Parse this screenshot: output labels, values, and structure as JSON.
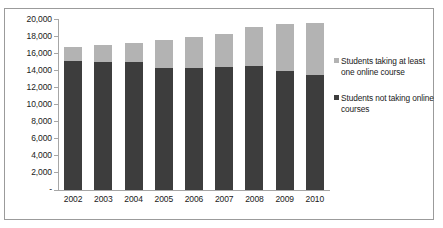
{
  "chart_data": {
    "type": "bar",
    "subtype": "stacked-column",
    "title": "",
    "subtitle": "",
    "xlabel": "",
    "ylabel": "",
    "categories": [
      "2002",
      "2003",
      "2004",
      "2005",
      "2006",
      "2007",
      "2008",
      "2009",
      "2010"
    ],
    "series": [
      {
        "name": "Students not taking online courses",
        "color": "#3d3d3d",
        "values": [
          15100,
          15000,
          14950,
          14250,
          14250,
          14350,
          14500,
          13900,
          13450
        ]
      },
      {
        "name": "Students taking at least one online course",
        "color": "#b3b3b3",
        "values": [
          1600,
          1950,
          2300,
          3250,
          3600,
          3900,
          4550,
          5550,
          6100
        ]
      }
    ],
    "totals": [
      16700,
      16950,
      17250,
      17500,
      17850,
      18250,
      19050,
      19450,
      19550
    ],
    "ylim": [
      0,
      20000
    ],
    "ytick_step": 2000,
    "ytick_labels": [
      "20,000",
      "18,000",
      "16,000",
      "14,000",
      "12,000",
      "10,000",
      "8,000",
      "6,000",
      "4,000",
      "2,000",
      "-"
    ],
    "ytick_values": [
      20000,
      18000,
      16000,
      14000,
      12000,
      10000,
      8000,
      6000,
      4000,
      2000,
      0
    ],
    "grid": false,
    "legend_position": "right",
    "legend": [
      {
        "label": "Students taking at least one online course",
        "color": "#b3b3b3"
      },
      {
        "label": "Students not taking online courses",
        "color": "#3d3d3d"
      }
    ]
  },
  "colors": {
    "online": "#b3b3b3",
    "not_online": "#3d3d3d",
    "axis": "#a6a6a6",
    "border": "#9b9b9b",
    "text": "#1a1a1a",
    "background": "#ffffff"
  }
}
